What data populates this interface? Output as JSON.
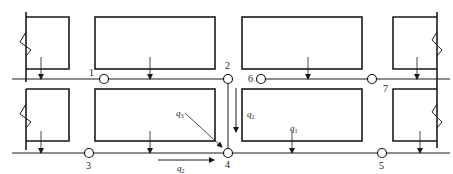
{
  "diagram": {
    "type": "pipe-network-plan",
    "nodes": [
      {
        "id": "1",
        "label": "1"
      },
      {
        "id": "2",
        "label": "2"
      },
      {
        "id": "3",
        "label": "3"
      },
      {
        "id": "4",
        "label": "4"
      },
      {
        "id": "5",
        "label": "5"
      },
      {
        "id": "6",
        "label": "6"
      },
      {
        "id": "7",
        "label": "7"
      }
    ],
    "flows": [
      {
        "id": "q1",
        "symbol": "q",
        "subscript": "1"
      },
      {
        "id": "q2_vertical",
        "symbol": "q",
        "subscript": "2"
      },
      {
        "id": "q2_horizontal",
        "symbol": "q",
        "subscript": "2"
      },
      {
        "id": "q3",
        "symbol": "q",
        "subscript": "3"
      }
    ],
    "edges": [
      {
        "from": "1",
        "to": "2"
      },
      {
        "from": "2",
        "to": "4"
      },
      {
        "from": "3",
        "to": "4"
      },
      {
        "from": "4",
        "to": "5"
      },
      {
        "from": "6",
        "to": "7"
      }
    ],
    "colors": {
      "line": "#1a1a1a",
      "background": "#ffffff"
    }
  }
}
